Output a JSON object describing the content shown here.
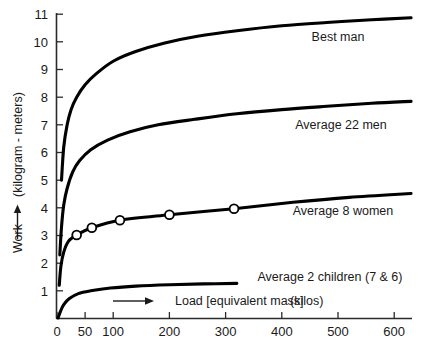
{
  "chart_data": {
    "type": "line",
    "title": "",
    "xlabel": "Load [equivalent mass]   (kilos)",
    "ylabel": "Work ⟶ (kilogram - meters)",
    "xlim": [
      0,
      635
    ],
    "ylim": [
      0,
      11
    ],
    "grid": false,
    "legend_position": "inline-right",
    "x_ticks": [
      "0",
      "50",
      "100",
      "200",
      "300",
      "400",
      "500",
      "600"
    ],
    "x_tick_values": [
      0,
      50,
      100,
      200,
      300,
      400,
      500,
      600
    ],
    "y_ticks": [
      "1",
      "2",
      "3",
      "4",
      "5",
      "6",
      "7",
      "8",
      "9",
      "10",
      "11"
    ],
    "y_tick_values": [
      1,
      2,
      3,
      4,
      5,
      6,
      7,
      8,
      9,
      10,
      11
    ],
    "series": [
      {
        "name": "Best man",
        "label": "Best man",
        "x": [
          8,
          12,
          18,
          25,
          35,
          50,
          70,
          100,
          140,
          190,
          250,
          320,
          400,
          480,
          560,
          630
        ],
        "values": [
          5.0,
          6.2,
          7.0,
          7.55,
          8.0,
          8.45,
          8.85,
          9.3,
          9.65,
          9.95,
          10.2,
          10.4,
          10.58,
          10.7,
          10.8,
          10.87
        ]
      },
      {
        "name": "Average 22 men",
        "label": "Average 22 men",
        "x": [
          5,
          8,
          12,
          18,
          28,
          40,
          60,
          90,
          130,
          180,
          245,
          320,
          400,
          480,
          560,
          630
        ],
        "values": [
          2.3,
          3.3,
          4.1,
          4.7,
          5.3,
          5.7,
          6.1,
          6.45,
          6.75,
          7.0,
          7.2,
          7.4,
          7.55,
          7.67,
          7.78,
          7.85
        ]
      },
      {
        "name": "Average 8 women",
        "label": "Average 8 women",
        "x": [
          4,
          7,
          12,
          20,
          35,
          62,
          112,
          200,
          315,
          420,
          520,
          630
        ],
        "values": [
          1.2,
          1.9,
          2.4,
          2.78,
          3.02,
          3.28,
          3.55,
          3.75,
          3.97,
          4.2,
          4.38,
          4.52
        ],
        "markers": [
          {
            "x": 35,
            "y": 3.02
          },
          {
            "x": 62,
            "y": 3.28
          },
          {
            "x": 112,
            "y": 3.55
          },
          {
            "x": 200,
            "y": 3.75
          },
          {
            "x": 315,
            "y": 3.97
          }
        ]
      },
      {
        "name": "Average 2 children (7 & 6)",
        "label": "Average 2 children (7 & 6)",
        "x": [
          2,
          6,
          12,
          22,
          38,
          60,
          95,
          140,
          200,
          260,
          320
        ],
        "values": [
          0.02,
          0.25,
          0.5,
          0.72,
          0.9,
          1.0,
          1.1,
          1.17,
          1.22,
          1.25,
          1.27
        ]
      }
    ],
    "annotations": [
      {
        "name": "x-direction-arrow",
        "text": ""
      }
    ]
  },
  "axis": {
    "y_label_work": "Work",
    "y_label_units": "(kilogram - meters)",
    "x_label_main": "Load [equivalent mass]",
    "x_label_units": "(kilos)"
  },
  "labels": {
    "best_man": "Best man",
    "average_22_men": "Average 22 men",
    "average_8_women": "Average 8 women",
    "average_2_children": "Average 2 children (7 & 6)"
  },
  "y_tick_labels": {
    "t11": "11",
    "t10": "10",
    "t9": "9",
    "t8": "8",
    "t7": "7",
    "t6": "6",
    "t5": "5",
    "t4": "4",
    "t3": "3",
    "t2": "2",
    "t1": "1"
  },
  "x_tick_labels": {
    "t0": "0",
    "t50": "50",
    "t100": "100",
    "t200": "200",
    "t300": "300",
    "t400": "400",
    "t500": "500",
    "t600": "600"
  },
  "colors": {
    "curve": "#000000",
    "axis": "#2b2b2b",
    "text": "#1a1a1a",
    "background": "#ffffff",
    "marker_fill": "#ffffff"
  }
}
